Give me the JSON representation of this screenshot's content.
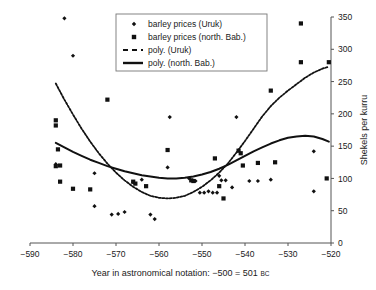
{
  "chart_data": {
    "type": "scatter",
    "title": "",
    "xlabel": "Year in astronomical notation: −500 = 501 BC",
    "xlabel_main": "Year in astronomical notation: −500 = 501",
    "xlabel_suffix": "BC",
    "ylabel": "Shekels per kurru",
    "xlim": [
      -590,
      -520
    ],
    "ylim": [
      0,
      350
    ],
    "xticks": [
      -590,
      -580,
      -570,
      -560,
      -550,
      -540,
      -530,
      -520
    ],
    "xticklabels": [
      "−590",
      "−580",
      "−570",
      "−560",
      "−550",
      "−540",
      "−530",
      "−520"
    ],
    "yticks": [
      0,
      50,
      100,
      150,
      200,
      250,
      300,
      350
    ],
    "yticklabels": [
      "0",
      "50",
      "100",
      "150",
      "200",
      "250",
      "300",
      "350"
    ],
    "grid": false,
    "legend_position": "top-center",
    "legend": [
      {
        "label": "barley prices (Uruk)",
        "marker": "diamond",
        "color": "#111111"
      },
      {
        "label": "barley prices (north. Bab.)",
        "marker": "square",
        "color": "#111111"
      },
      {
        "label": "poly. (Uruk)",
        "marker": "dashed-line",
        "color": "#111111"
      },
      {
        "label": "poly. (north. Bab.)",
        "marker": "solid-line",
        "color": "#111111"
      }
    ],
    "series": [
      {
        "name": "barley prices (Uruk)",
        "marker": "diamond",
        "color": "#111111",
        "points": [
          [
            -584.0,
            122.0
          ],
          [
            -582.0,
            348.0
          ],
          [
            -580.0,
            290.0
          ],
          [
            -575.0,
            108.0
          ],
          [
            -575.0,
            57.0
          ],
          [
            -571.0,
            44.0
          ],
          [
            -569.5,
            45.0
          ],
          [
            -568.0,
            48.0
          ],
          [
            -566.0,
            94.0
          ],
          [
            -564.0,
            98.0
          ],
          [
            -562.0,
            44.0
          ],
          [
            -561.0,
            37.0
          ],
          [
            -558.0,
            117.0
          ],
          [
            -557.5,
            195.0
          ],
          [
            -553.0,
            100.0
          ],
          [
            -551.5,
            96.0
          ],
          [
            -550.5,
            78.0
          ],
          [
            -549.5,
            78.0
          ],
          [
            -548.5,
            80.0
          ],
          [
            -547.5,
            78.0
          ],
          [
            -546.5,
            78.0
          ],
          [
            -546.0,
            104.0
          ],
          [
            -545.5,
            97.0
          ],
          [
            -544.5,
            97.0
          ],
          [
            -543.0,
            86.0
          ],
          [
            -542.0,
            195.0
          ],
          [
            -539.0,
            96.0
          ],
          [
            -537.0,
            96.0
          ],
          [
            -534.0,
            98.0
          ],
          [
            -524.0,
            142.0
          ],
          [
            -524.0,
            80.0
          ]
        ]
      },
      {
        "name": "barley prices (north. Bab.)",
        "marker": "square",
        "color": "#111111",
        "points": [
          [
            -584.0,
            190.0
          ],
          [
            -584.0,
            182.0
          ],
          [
            -583.5,
            145.0
          ],
          [
            -584.0,
            119.0
          ],
          [
            -583.0,
            120.0
          ],
          [
            -583.0,
            95.0
          ],
          [
            -580.0,
            84.0
          ],
          [
            -576.0,
            83.0
          ],
          [
            -572.0,
            222.0
          ],
          [
            -566.0,
            95.0
          ],
          [
            -565.5,
            92.0
          ],
          [
            -563.0,
            88.0
          ],
          [
            -558.0,
            144.0
          ],
          [
            -552.5,
            97.0
          ],
          [
            -552.0,
            96.0
          ],
          [
            -547.0,
            131.0
          ],
          [
            -546.0,
            88.0
          ],
          [
            -545.0,
            69.0
          ],
          [
            -541.5,
            143.0
          ],
          [
            -541.0,
            139.0
          ],
          [
            -540.5,
            120.0
          ],
          [
            -537.0,
            124.0
          ],
          [
            -533.0,
            125.0
          ],
          [
            -534.0,
            236.0
          ],
          [
            -527.0,
            340.0
          ],
          [
            -527.0,
            280.0
          ],
          [
            -521.0,
            100.0
          ],
          [
            -520.5,
            280.0
          ]
        ]
      }
    ],
    "trendlines": [
      {
        "name": "poly. (Uruk)",
        "style": "dashed",
        "color": "#111111",
        "points": [
          [
            -584.0,
            247.0
          ],
          [
            -582.0,
            222.0
          ],
          [
            -580.0,
            199.0
          ],
          [
            -578.0,
            177.0
          ],
          [
            -576.0,
            157.0
          ],
          [
            -574.0,
            139.0
          ],
          [
            -572.0,
            123.0
          ],
          [
            -570.0,
            109.0
          ],
          [
            -568.0,
            97.0
          ],
          [
            -566.0,
            87.0
          ],
          [
            -564.0,
            79.0
          ],
          [
            -562.0,
            73.0
          ],
          [
            -560.0,
            70.0
          ],
          [
            -558.0,
            69.0
          ],
          [
            -556.0,
            70.0
          ],
          [
            -554.0,
            73.0
          ],
          [
            -552.0,
            79.0
          ],
          [
            -550.0,
            87.0
          ],
          [
            -548.0,
            97.0
          ],
          [
            -546.0,
            109.0
          ],
          [
            -544.0,
            123.0
          ],
          [
            -542.0,
            140.0
          ],
          [
            -540.0,
            158.0
          ],
          [
            -538.0,
            177.0
          ],
          [
            -536.0,
            196.0
          ],
          [
            -534.0,
            212.0
          ],
          [
            -532.0,
            225.0
          ],
          [
            -530.0,
            236.0
          ],
          [
            -528.0,
            246.0
          ],
          [
            -526.0,
            256.0
          ],
          [
            -524.0,
            264.0
          ],
          [
            -522.0,
            270.0
          ],
          [
            -520.5,
            273.0
          ]
        ]
      },
      {
        "name": "poly. (north. Bab.)",
        "style": "solid",
        "color": "#111111",
        "points": [
          [
            -584.0,
            155.0
          ],
          [
            -582.0,
            148.0
          ],
          [
            -580.0,
            141.0
          ],
          [
            -578.0,
            135.0
          ],
          [
            -576.0,
            129.0
          ],
          [
            -574.0,
            124.0
          ],
          [
            -572.0,
            119.0
          ],
          [
            -570.0,
            115.0
          ],
          [
            -568.0,
            111.0
          ],
          [
            -566.0,
            108.0
          ],
          [
            -564.0,
            105.0
          ],
          [
            -562.0,
            103.0
          ],
          [
            -560.0,
            101.0
          ],
          [
            -558.0,
            100.0
          ],
          [
            -556.0,
            100.0
          ],
          [
            -554.0,
            101.0
          ],
          [
            -552.0,
            103.0
          ],
          [
            -550.0,
            106.0
          ],
          [
            -548.0,
            110.0
          ],
          [
            -546.0,
            115.0
          ],
          [
            -544.0,
            121.0
          ],
          [
            -542.0,
            128.0
          ],
          [
            -540.0,
            135.0
          ],
          [
            -538.0,
            142.0
          ],
          [
            -536.0,
            148.0
          ],
          [
            -534.0,
            154.0
          ],
          [
            -532.0,
            159.0
          ],
          [
            -530.0,
            163.0
          ],
          [
            -528.0,
            165.0
          ],
          [
            -526.0,
            166.0
          ],
          [
            -524.0,
            165.0
          ],
          [
            -522.0,
            161.0
          ],
          [
            -520.5,
            157.0
          ]
        ]
      }
    ]
  }
}
